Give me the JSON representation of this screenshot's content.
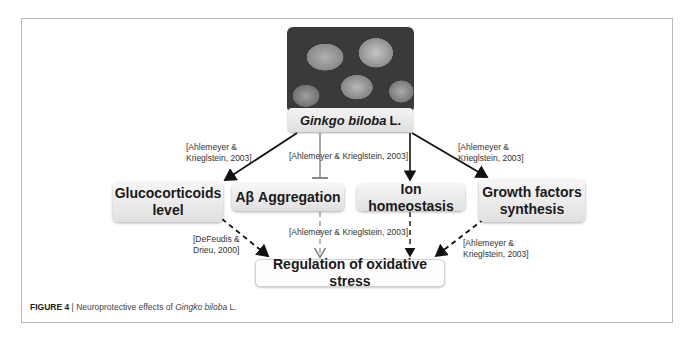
{
  "diagram": {
    "source": {
      "label_italic": "Ginkgo biloba",
      "label_suffix": "L.",
      "image": "ginkgo-leaves-photo"
    },
    "nodes": [
      {
        "id": "glucocorticoids",
        "label": "Glucocorticoids level"
      },
      {
        "id": "abeta",
        "label": "Aβ Aggregation"
      },
      {
        "id": "ion",
        "label": "Ion homeostasis"
      },
      {
        "id": "growth",
        "label": "Growth factors synthesis"
      }
    ],
    "outcome": {
      "label": "Regulation of oxidative stress"
    },
    "citations": {
      "to_glucocorticoids": [
        "[Ahlemeyer &",
        "Krieglstein, 2003]"
      ],
      "center_top": "[Ahlemeyer & Krieglstein, 2003]",
      "to_growth": [
        "[Ahlemeyer &",
        "Krieglstein, 2003]"
      ],
      "gluco_to_outcome": [
        "[DeFeudis &",
        "Drieu, 2000]"
      ],
      "center_bottom": "[Ahlemeyer & Krieglstein, 2003]",
      "growth_to_outcome": [
        "[Ahlemeyer &",
        "Krieglstein, 2003]"
      ]
    },
    "edges": [
      {
        "from": "source",
        "to": "glucocorticoids",
        "style": "solid-arrow"
      },
      {
        "from": "source",
        "to": "abeta",
        "style": "inhibition"
      },
      {
        "from": "source",
        "to": "ion",
        "style": "solid-arrow"
      },
      {
        "from": "source",
        "to": "growth",
        "style": "solid-arrow"
      },
      {
        "from": "glucocorticoids",
        "to": "outcome",
        "style": "dashed-arrow"
      },
      {
        "from": "abeta",
        "to": "outcome",
        "style": "dashed-arrow-gray"
      },
      {
        "from": "ion",
        "to": "outcome",
        "style": "dashed-arrow"
      },
      {
        "from": "growth",
        "to": "outcome",
        "style": "dashed-arrow"
      }
    ]
  },
  "caption": {
    "label": "FIGURE 4",
    "separator": " | ",
    "text_before": "Neuroprotective effects of ",
    "text_italic": "Gingko biloba",
    "text_after": " L."
  }
}
